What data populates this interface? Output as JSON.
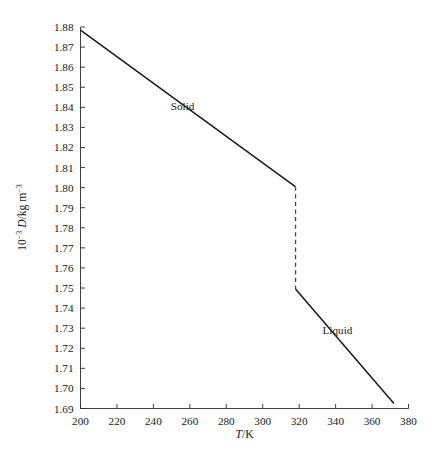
{
  "chart_data": {
    "type": "line",
    "title": "",
    "subtitle": "",
    "xlabel": "T/K",
    "ylabel": "10^-3 D/kg m^-3",
    "ylabel_parts": {
      "prefix": "10",
      "prefix_exp": "−3",
      "quantity": "D",
      "unit_sep": "/kg m",
      "unit_exp": "−3"
    },
    "xlabel_parts": {
      "symbol": "T",
      "rest": "/K"
    },
    "xlim": [
      200,
      380
    ],
    "ylim": [
      1.69,
      1.88
    ],
    "xticks": [
      200,
      220,
      240,
      260,
      280,
      300,
      320,
      340,
      360,
      380
    ],
    "xtick_labels": [
      "200",
      "220",
      "240",
      "260",
      "280",
      "300",
      "320",
      "340",
      "360",
      "380"
    ],
    "yticks": [
      1.69,
      1.7,
      1.71,
      1.72,
      1.73,
      1.74,
      1.75,
      1.76,
      1.77,
      1.78,
      1.79,
      1.8,
      1.81,
      1.82,
      1.83,
      1.84,
      1.85,
      1.86,
      1.87,
      1.88
    ],
    "ytick_labels": [
      "1.69",
      "1.70",
      "1.71",
      "1.72",
      "1.73",
      "1.74",
      "1.75",
      "1.76",
      "1.77",
      "1.78",
      "1.79",
      "1.80",
      "1.81",
      "1.82",
      "1.83",
      "1.84",
      "1.85",
      "1.86",
      "1.87",
      "1.88"
    ],
    "grid": false,
    "legend": "none",
    "series": [
      {
        "name": "Solid",
        "style": "solid",
        "x": [
          200,
          316,
          318
        ],
        "y": [
          1.8785,
          1.8018,
          1.8005
        ]
      },
      {
        "name": "transition",
        "style": "dashed",
        "x": [
          318,
          318
        ],
        "y": [
          1.8005,
          1.7495
        ]
      },
      {
        "name": "Liquid",
        "style": "solid",
        "x": [
          318,
          372
        ],
        "y": [
          1.7495,
          1.6925
        ]
      }
    ],
    "annotations": [
      {
        "text": "Solid",
        "x": 256,
        "y": 1.8385
      },
      {
        "text": "Liquid",
        "x": 341,
        "y": 1.7272
      }
    ]
  }
}
